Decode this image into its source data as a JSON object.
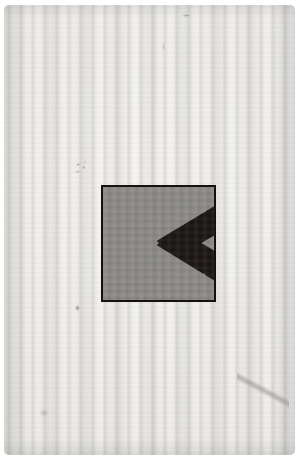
{
  "image": {
    "subject": "scanned card with printed geometric figure",
    "medium": "paper card, scanner banding visible",
    "width_px": 299,
    "height_px": 460,
    "background_color": "#ffffff"
  },
  "card": {
    "name": "paper card",
    "paper_color": "#f2f1ef",
    "edge_shadow_color": "#96948e",
    "corner_radius_px": 5,
    "texture": "vertical scan bands"
  },
  "figure": {
    "name": "chevron figure",
    "shape": "square panel containing a leftward-pointing chevron",
    "frame_color": "#14110f",
    "frame_width_px": 2,
    "ground_color": "#8b8a87",
    "ink_color": "#1a1715",
    "left_px": 97,
    "top_px": 180,
    "width_px": 115,
    "height_px": 117,
    "chevron_points": "148,0 200,0 102,58 200,117 148,117 52,58",
    "ground_notch_points": "0,0 0,117 58,58"
  },
  "marks": {
    "smudge_above_left": "faint pencil smudge",
    "dot_below_left": "small dark speck",
    "crease_bottom_right": "soft diagonal crease",
    "speck_top": "small dark fleck near top edge",
    "speck_upper_mid": "faint grey streak",
    "speck_lower_left": "faint scuff near lower left"
  }
}
